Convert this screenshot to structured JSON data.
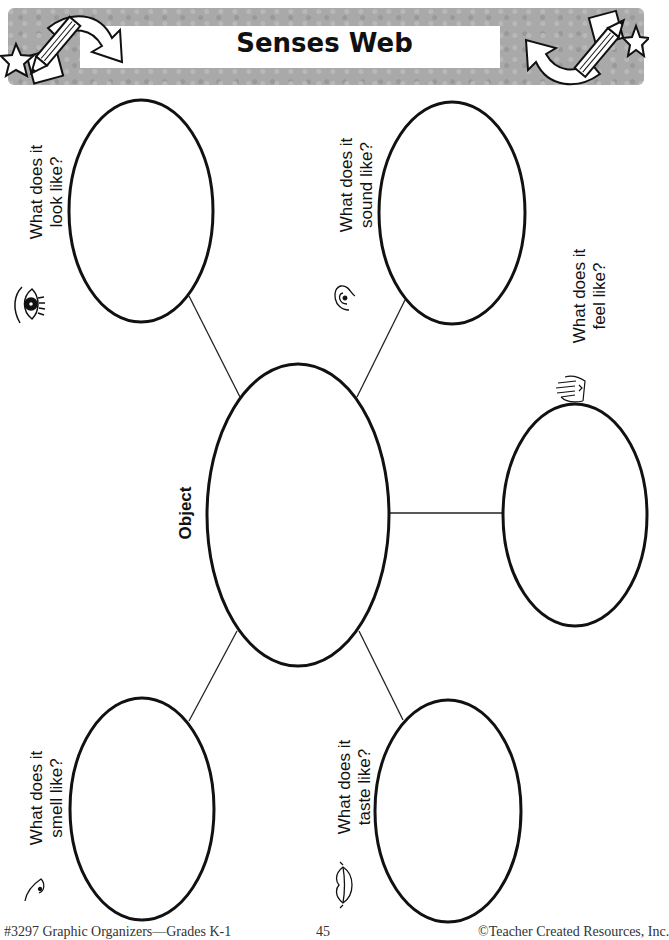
{
  "header": {
    "title": "Senses Web",
    "decorations": [
      "pencil-icon",
      "star-icon",
      "curved-arrow-icon",
      "paper-square-icon"
    ]
  },
  "center": {
    "label": "Object"
  },
  "senses": [
    {
      "id": "sight",
      "line1": "What does it",
      "line2": "look like?",
      "icon": "eye-icon"
    },
    {
      "id": "hearing",
      "line1": "What does it",
      "line2": "sound like?",
      "icon": "ear-icon"
    },
    {
      "id": "touch",
      "line1": "What does it",
      "line2": "feel like?",
      "icon": "hand-icon"
    },
    {
      "id": "smell",
      "line1": "What does it",
      "line2": "smell like?",
      "icon": "nose-icon"
    },
    {
      "id": "taste",
      "line1": "What does it",
      "line2": "taste like?",
      "icon": "lips-icon"
    }
  ],
  "footer": {
    "left": "#3297 Graphic Organizers—Grades K-1",
    "center": "45",
    "right": "©Teacher Created Resources, Inc."
  },
  "colors": {
    "band": "#a9a9a9",
    "stroke": "#111111"
  }
}
